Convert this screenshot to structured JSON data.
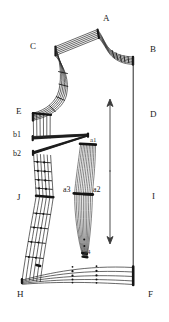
{
  "figure": {
    "background_color": "#ffffff",
    "line_color": "#262626",
    "node_color": "#111111",
    "width": 169,
    "height": 322
  },
  "labels": [
    {
      "id": "A",
      "text": "A",
      "x": 103,
      "y": 14,
      "size": "normal"
    },
    {
      "id": "B",
      "text": "B",
      "x": 150,
      "y": 45,
      "size": "normal"
    },
    {
      "id": "C",
      "text": "C",
      "x": 30,
      "y": 42,
      "size": "normal"
    },
    {
      "id": "D",
      "text": "D",
      "x": 150,
      "y": 110,
      "size": "normal"
    },
    {
      "id": "E",
      "text": "E",
      "x": 16,
      "y": 111,
      "size": "normal"
    },
    {
      "id": "b1",
      "text": "b1",
      "x": 14,
      "y": 132,
      "size": "sm"
    },
    {
      "id": "b2",
      "text": "b2",
      "x": 14,
      "y": 152,
      "size": "sm"
    },
    {
      "id": "a1",
      "text": "a1",
      "x": 89,
      "y": 141,
      "size": "tiny"
    },
    {
      "id": "a3",
      "text": "a3",
      "x": 64,
      "y": 190,
      "size": "sm"
    },
    {
      "id": "a2",
      "text": "a2",
      "x": 94,
      "y": 190,
      "size": "sm"
    },
    {
      "id": "J",
      "text": "J",
      "x": 18,
      "y": 194,
      "size": "normal"
    },
    {
      "id": "I",
      "text": "I",
      "x": 151,
      "y": 192,
      "size": "normal"
    },
    {
      "id": "a4",
      "text": "a4",
      "x": 84,
      "y": 250,
      "size": "tiny"
    },
    {
      "id": "H",
      "text": "H",
      "x": 18,
      "y": 293,
      "size": "normal"
    },
    {
      "id": "F",
      "text": "F",
      "x": 148,
      "y": 293,
      "size": "normal"
    }
  ],
  "annotations": {
    "grain_arrow": {
      "name": "grainline-double-arrow",
      "x": 110,
      "y_top": 100,
      "y_bottom": 243
    }
  },
  "geometry": {
    "shoulder_bundle": {
      "name": "shoulder-seam-bundle",
      "count": 6,
      "left_anchor": [
        55,
        47
      ],
      "apex": [
        98,
        29
      ]
    },
    "neck_bundle": {
      "name": "neckline-bundle",
      "count": 6,
      "apex": [
        98,
        29
      ],
      "right_anchor": [
        133,
        57
      ]
    },
    "armhole_curve": {
      "name": "armhole-curve-bundle",
      "count": 6,
      "top": [
        55,
        47
      ],
      "bulge": [
        68,
        85
      ],
      "bottom": [
        33,
        113
      ]
    },
    "side_seam": {
      "name": "side-seam-right-vertical",
      "top": [
        133,
        57
      ],
      "bottom": [
        133,
        283
      ]
    },
    "bust_dart": {
      "name": "bust-dart-wedge",
      "apex": [
        88,
        134
      ],
      "upper_left": [
        32,
        137
      ],
      "lower_left": [
        33,
        153
      ]
    },
    "waist_dart": {
      "name": "waist-dart-bundle",
      "top": [
        88,
        144
      ],
      "widest": [
        88,
        193
      ],
      "bottom": [
        84,
        256
      ]
    },
    "left_panel": {
      "name": "left-panel-curve-bundle",
      "count": 6,
      "top": [
        33,
        155
      ],
      "mid": [
        40,
        196
      ],
      "bottom": [
        22,
        280
      ]
    },
    "hem_bundle": {
      "name": "hem-curve-bundle",
      "count": 5,
      "left": [
        22,
        280
      ],
      "right": [
        133,
        277
      ]
    }
  }
}
